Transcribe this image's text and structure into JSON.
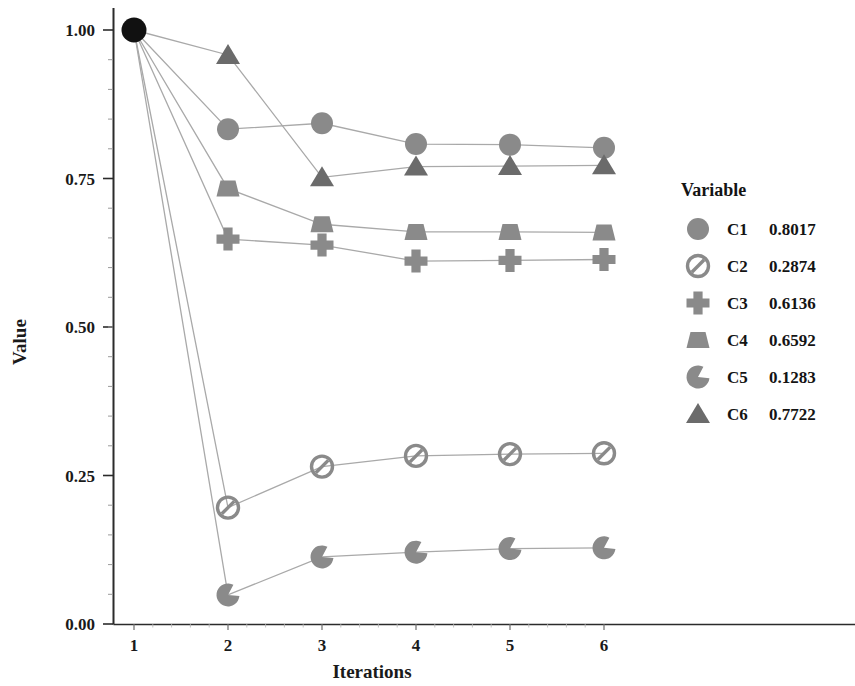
{
  "chart_data": {
    "type": "line",
    "title": "",
    "xlabel": "Iterations",
    "ylabel": "Value",
    "x": [
      1,
      2,
      3,
      4,
      5,
      6
    ],
    "xticklabels": [
      "1",
      "2",
      "3",
      "4",
      "5",
      "6"
    ],
    "yticklabels": [
      "0.00",
      "0.25",
      "0.50",
      "0.75",
      "1.00"
    ],
    "yticks": [
      0.0,
      0.25,
      0.5,
      0.75,
      1.0
    ],
    "ylim": [
      0.0,
      1.0
    ],
    "xlim": [
      1,
      6
    ],
    "grid": false,
    "legend_position": "right",
    "legend_title": "Variable",
    "origin_marker": {
      "name": "start-point",
      "x": 1,
      "y": 1.0,
      "color": "#111111",
      "shape": "filled-circle"
    },
    "series": [
      {
        "name": "C1",
        "final_value": "0.8017",
        "marker": "circle",
        "color": "#8a8a8a",
        "values": [
          1.0,
          0.833,
          0.843,
          0.808,
          0.807,
          0.8017
        ]
      },
      {
        "name": "C2",
        "final_value": "0.2874",
        "marker": "circle-slash",
        "color": "#8a8a8a",
        "values": [
          1.0,
          0.196,
          0.265,
          0.283,
          0.286,
          0.2874
        ]
      },
      {
        "name": "C3",
        "final_value": "0.6136",
        "marker": "cross",
        "color": "#8a8a8a",
        "values": [
          1.0,
          0.648,
          0.638,
          0.611,
          0.612,
          0.6136
        ]
      },
      {
        "name": "C4",
        "final_value": "0.6592",
        "marker": "trapezoid",
        "color": "#8a8a8a",
        "values": [
          1.0,
          0.733,
          0.673,
          0.66,
          0.66,
          0.6592
        ]
      },
      {
        "name": "C5",
        "final_value": "0.1283",
        "marker": "pacman",
        "color": "#8a8a8a",
        "values": [
          1.0,
          0.049,
          0.113,
          0.121,
          0.127,
          0.1283
        ]
      },
      {
        "name": "C6",
        "final_value": "0.7722",
        "marker": "triangle",
        "color": "#6b6b6b",
        "values": [
          1.0,
          0.958,
          0.752,
          0.77,
          0.771,
          0.7722
        ]
      }
    ]
  },
  "legend": {
    "title": "Variable",
    "entries": [
      {
        "label": "C1",
        "value": "0.8017",
        "marker": "circle"
      },
      {
        "label": "C2",
        "value": "0.2874",
        "marker": "circle-slash"
      },
      {
        "label": "C3",
        "value": "0.6136",
        "marker": "cross"
      },
      {
        "label": "C4",
        "value": "0.6592",
        "marker": "trapezoid"
      },
      {
        "label": "C5",
        "value": "0.1283",
        "marker": "pacman"
      },
      {
        "label": "C6",
        "value": "0.7722",
        "marker": "triangle"
      }
    ]
  },
  "axes": {
    "x_title": "Iterations",
    "y_title": "Value",
    "x_ticks": [
      "1",
      "2",
      "3",
      "4",
      "5",
      "6"
    ],
    "y_ticks": [
      "0.00",
      "0.25",
      "0.50",
      "0.75",
      "1.00"
    ]
  },
  "colors": {
    "marker_gray": "#8a8a8a",
    "triangle_gray": "#6b6b6b",
    "line_gray": "#a9a9a9",
    "axis_black": "#2b2b2b",
    "start_black": "#111111"
  }
}
